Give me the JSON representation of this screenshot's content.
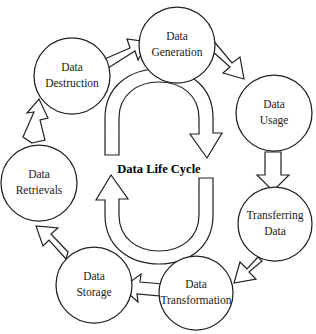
{
  "diagram": {
    "title": "Data Life Cycle",
    "center_label": "Data Life Cycle",
    "background_color": "#ffffff",
    "stroke_color": "#231f20",
    "nodes": [
      {
        "id": "data-generation",
        "label_line1": "Data",
        "label_line2": "Generation",
        "cx": 177,
        "cy": 45,
        "r": 38
      },
      {
        "id": "data-usage",
        "label_line1": "Data",
        "label_line2": "Usage",
        "cx": 274,
        "cy": 113,
        "r": 38
      },
      {
        "id": "transferring-data",
        "label_line1": "Transferring",
        "label_line2": "Data",
        "cx": 275,
        "cy": 224,
        "r": 37
      },
      {
        "id": "data-transformation",
        "label_line1": "Data",
        "label_line2": "Transformation",
        "cx": 196,
        "cy": 293,
        "r": 37
      },
      {
        "id": "data-storage",
        "label_line1": "Data",
        "label_line2": "Storage",
        "cx": 94,
        "cy": 285,
        "r": 38
      },
      {
        "id": "data-retrievals",
        "label_line1": "Data",
        "label_line2": "Retrievals",
        "cx": 39,
        "cy": 183,
        "r": 38
      },
      {
        "id": "data-destruction",
        "label_line1": "Data",
        "label_line2": "Destruction",
        "cx": 72,
        "cy": 76,
        "r": 38
      }
    ],
    "connectors": [
      {
        "id": "arrow-destruction-to-generation",
        "from": "data-destruction",
        "to": "data-generation",
        "direction": "up-right"
      },
      {
        "id": "arrow-generation-to-usage",
        "from": "data-generation",
        "to": "data-usage",
        "direction": "down-right"
      },
      {
        "id": "arrow-usage-to-transferring",
        "from": "data-usage",
        "to": "transferring-data",
        "direction": "down"
      },
      {
        "id": "arrow-transferring-to-transformation",
        "from": "transferring-data",
        "to": "data-transformation",
        "direction": "down-left"
      },
      {
        "id": "arrow-transformation-to-storage",
        "from": "data-transformation",
        "to": "data-storage",
        "direction": "left"
      },
      {
        "id": "arrow-storage-to-retrievals",
        "from": "data-storage",
        "to": "data-retrievals",
        "direction": "up-left"
      },
      {
        "id": "arrow-retrievals-to-destruction",
        "from": "data-retrievals",
        "to": "data-destruction",
        "direction": "up"
      }
    ],
    "cycle_arrows": [
      {
        "id": "inner-arrow-top",
        "description": "clockwise curved arrow over the top of the center label"
      },
      {
        "id": "inner-arrow-bottom",
        "description": "clockwise curved arrow under the center label"
      }
    ]
  }
}
